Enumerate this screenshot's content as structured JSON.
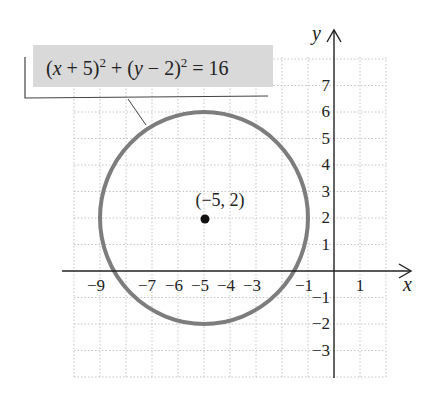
{
  "chart_data": {
    "type": "scatter",
    "title": "",
    "equation": "(x + 5)^2 + (y - 2)^2 = 16",
    "equation_parts": {
      "lhs1": "(x + 5)",
      "exp1": "2",
      "plus": " + (",
      "y": "y",
      "rest": " − 2)",
      "exp2": "2",
      "rhs": " = 16"
    },
    "center": {
      "x": -5,
      "y": 2,
      "label": "(−5, 2)"
    },
    "radius": 4,
    "xlabel": "x",
    "ylabel": "y",
    "xlim": [
      -10,
      2
    ],
    "ylim": [
      -4,
      8
    ],
    "grid": true,
    "x_ticks": [
      "−9",
      "−7",
      "−6",
      "−5",
      "−4",
      "−3",
      "−1",
      "1"
    ],
    "y_ticks": [
      "7",
      "6",
      "5",
      "4",
      "3",
      "2",
      "1",
      "−1",
      "−2",
      "−3"
    ]
  },
  "colors": {
    "circle": "#7a7a7a",
    "axis": "#222222",
    "grid": "#bdbdbd",
    "label_box": "#d9d9d9"
  }
}
